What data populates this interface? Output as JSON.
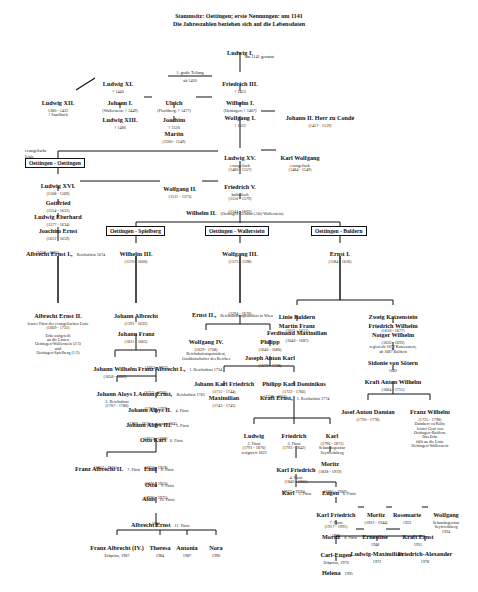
{
  "title": {
    "line1": "Stammsitz: Oettingen; erste Nennungen: um 1141",
    "line2": "Die Jahreszahlen beziehen sich auf die Lebensdaten"
  },
  "branches": {
    "oettingen_oettingen": "Oettingen - Oettingen",
    "oettingen_spielberg": "Oettingen - Spielberg",
    "oettingen_wallerstein": "Oettingen - Wallerstein",
    "oettingen_baldern": "Oettingen - Baldern"
  },
  "labels": {
    "evangelische_linie_1": "evangelische",
    "evangelische_linie_2": "Linie",
    "teilung_1": "1. große Teilung",
    "teilung_2": "ab 1410"
  },
  "persons": {
    "ludwig_1": {
      "name": "Ludwig I.",
      "note": "um 1141 genannt"
    },
    "ludwig_11": {
      "name": "Ludwig XI.",
      "dates": "† 1440"
    },
    "friedrich_3": {
      "name": "Friedrich III.",
      "dates": "† 1423"
    },
    "ludwig_12": {
      "name": "Ludwig XII.",
      "dates": "1380 - 1422",
      "note": "† Saarlbach"
    },
    "johann_1": {
      "name": "Johann I.",
      "dates": "(Wallerstein; † 1449)"
    },
    "ulrich": {
      "name": "Ulrich",
      "dates": "(Flochberg; † 1477)"
    },
    "wilhelm_1": {
      "name": "Wilhelm I.",
      "dates": "(Oettingen; † 1467)"
    },
    "ludwig_13": {
      "name": "Ludwig XIII.",
      "dates": "† 1486"
    },
    "joachim": {
      "name": "Joachim",
      "dates": "† 1520"
    },
    "wolfgang_1": {
      "name": "Wolfgang I.",
      "dates": "† 1522"
    },
    "johann_2": {
      "name": "Johann II. Herr zu Condé",
      "dates": "(1457 - 1519)"
    },
    "martin": {
      "name": "Martin",
      "dates": "(1500 - 1549)"
    },
    "ludwig_15": {
      "name": "Ludwig XV.",
      "note": "evangelisch",
      "dates": "(1486 - 1557)"
    },
    "karl_wolfgang": {
      "name": "Karl Wolfgang",
      "note": "evangelisch",
      "dates": "(1484 - 1549)"
    },
    "ludwig_16": {
      "name": "Ludwig XVI.",
      "dates": "(1508 - 1569)"
    },
    "wolfgang_2": {
      "name": "Wolfgang II.",
      "dates": "(1511 - 1573)"
    },
    "friedrich_5": {
      "name": "Friedrich V.",
      "note": "katholisch",
      "dates": "(1516 - 1579)"
    },
    "gottfried": {
      "name": "Gottfried",
      "dates": "(1554 - 1622)"
    },
    "wilhelm_2": {
      "name": "Wilhelm II.",
      "note": "(Oettingen-Gesamt (Alt)-Wallerstein)",
      "dates": "(1544 - 1602)"
    },
    "ludwig_eberhard": {
      "name": "Ludwig Eberhard",
      "dates": "(1577 - 1634)"
    },
    "joachim_ernst": {
      "name": "Joachim Ernst",
      "dates": "(1612 - 1659)"
    },
    "albrecht_ernst_1": {
      "name": "Albrecht Ernst I.,",
      "note": "Reichsfürst 1674",
      "dates": "(1642 - 1683)"
    },
    "wilhelm_3": {
      "name": "Wilhelm III.",
      "dates": "(1570 - 1600)"
    },
    "wolfgang_3": {
      "name": "Wolfgang III.",
      "dates": "(1573 - 1598)"
    },
    "ernst_1": {
      "name": "Ernst I.",
      "dates": "(1584 - 1626)"
    },
    "albrecht_ernst_2": {
      "name": "Albrecht Ernst II.",
      "note": "letzter Fürst der evangelischen Linie",
      "dates": "(1669 - 1731)",
      "inheritance": [
        "Erbe aufgeteilt",
        "an die Linien",
        "Oettingen-Wallerstein (2/3)",
        "und",
        "Oettingen-Spielberg (1/3)"
      ]
    },
    "johann_albrecht": {
      "name": "Johann Albrecht",
      "dates": "(1591 - 1632)"
    },
    "ernst_2": {
      "name": "Ernst II.,",
      "note": "Reichshofratspräsident in Wien",
      "dates": "(1594 - 1670)"
    },
    "linie_baldern": {
      "name": "Linie Baldern"
    },
    "martin_franz": {
      "name": "Martin Franz",
      "dates": "(1621 - 1653)"
    },
    "zweig_katzenstein": {
      "name": "Zweig Katzenstein"
    },
    "friedrich_wilhelm_1": {
      "name": "Friedrich Wilhelm",
      "dates": "(1618 - 1677)"
    },
    "johann_franz": {
      "name": "Johann Franz",
      "dates": "(1631 - 1665)"
    },
    "wolfgang_4": {
      "name": "Wolfgang IV.",
      "dates": "(1629 - 1708)",
      "note": [
        "Reichshofratspräsident,",
        "Großbotschafter des Reiches"
      ]
    },
    "philipp": {
      "name": "Philipp",
      "dates": "(1640 - 1680)"
    },
    "ferdinand_maximilian": {
      "name": "Ferdinand Maximilian",
      "dates": "(1640 - 1687)"
    },
    "notger_wilhelm": {
      "name": "Notger Wilhelm",
      "dates": "(1650 - 1693)",
      "note": [
        "regiert ab 1677 Katzenstein,",
        "ab 1687 Baldern"
      ]
    },
    "marriage_symbol": "∞",
    "sidonie": {
      "name": "Sidonie von Sötern",
      "dates": "1682"
    },
    "joseph_anton_karl": {
      "name": "Joseph Anton Karl",
      "dates": "(1679 - 1738)"
    },
    "johann_wilhelm": {
      "name": "Johann Wilhelm",
      "dates": "(1658 - 1683)"
    },
    "franz_albrecht_1": {
      "name": "Franz Albrecht I.,",
      "note": "1. Reichsfürst 1734",
      "dates": "(1663 - 1737)"
    },
    "kraft_anton_wilhelm": {
      "name": "Kraft Anton Wilhelm",
      "dates": "(1684 - 1751)"
    },
    "johann_karl_friedrich": {
      "name": "Johann Karl Friedrich",
      "dates": "(1715 - 1744)"
    },
    "philipp_karl_dominikus": {
      "name": "Philipp Karl Dominikus",
      "dates": "(1722 - 1766)"
    },
    "johann_aloys_1": {
      "name": "Johann Aloys I.",
      "note": "2. Reichsfürst",
      "dates": "(1707 - 1780)"
    },
    "anton_ernst": {
      "name": "Anton Ernst,",
      "note": "Reichsfürst 1765",
      "dates": "(1712 - 1768)"
    },
    "maximilian": {
      "name": "Maximilian",
      "dates": "(1743 - 1745)"
    },
    "kraft_ernst_1": {
      "name": "Kraft Ernst,",
      "note": "1. Reichsfürst 1774",
      "dates": "(1748 - 1802)"
    },
    "josef_anton_damian": {
      "name": "Josef Anton Damian",
      "dates": "(1720 - 1778)"
    },
    "franz_wilhelm": {
      "name": "Franz Wilhelm",
      "dates": "(1725 - 1798)",
      "note": [
        "Domherr zu Köln;",
        "letzter Graf von",
        "Oettingen-Baldern.",
        "Das Erbe",
        "fällt an die Linie",
        "Oettingen-Wallerstein"
      ]
    },
    "johann_aloys_2": {
      "name": "Johann Aloys II.",
      "note": "4. Fürst",
      "dates": "(1758 - 1797)"
    },
    "ludwig_fuerst2": {
      "name": "Ludwig",
      "note": "2. Fürst",
      "dates": "(1791 - 1870)",
      "note2": "resigniert 1823"
    },
    "friedrich_fuerst3": {
      "name": "Friedrich",
      "note": "3. Fürst",
      "dates": "(1793 - 1842)"
    },
    "karl_sekundo": {
      "name": "Karl",
      "dates": "(1796 - 1871)",
      "note": [
        "Sekundogenitur",
        "Seyfriedsberg"
      ]
    },
    "johann_aloys_3": {
      "name": "Johann Aloys III.",
      "note": "5. Fürst",
      "dates": "(1788 - 1855) resigniert 1845"
    },
    "karl_friedrich_4": {
      "name": "Karl Friedrich",
      "note": "4. Fürst",
      "dates": "(1840 - 1905)"
    },
    "moritz_1": {
      "name": "Moritz",
      "dates": "(1838 - 1919)"
    },
    "otto_karl": {
      "name": "Otto Karl",
      "note": "6. Fürst",
      "dates": "(1815 - 1882)"
    },
    "franz_albrecht_2": {
      "name": "Franz Albrecht II.",
      "note": "7. Fürst",
      "dates": "(1847 - 1916)"
    },
    "emil": {
      "name": "Emil",
      "note": "8. Fürst",
      "dates": "(1850 - 1919)"
    },
    "karl_5": {
      "name": "Karl",
      "note": "5. Fürst",
      "dates": "(1877 - 1930)"
    },
    "eugen": {
      "name": "Eugen",
      "note": "6. Fürst",
      "dates": "(1885 - 1969)"
    },
    "otto": {
      "name": "Otto",
      "note": "9. Fürst",
      "dates": "(1870 - 1952)"
    },
    "karl_friedrich_7": {
      "name": "Karl Friedrich",
      "note": "7. Fürst",
      "dates": "(1917 - 1991)"
    },
    "moritz_2": {
      "name": "Moritz",
      "dates": "(1922 - 1944)"
    },
    "rosemarie": {
      "name": "Rosemarie",
      "dates": "1923"
    },
    "wolfgang_sek": {
      "name": "Wolfgang",
      "note": [
        "Sekundogenitur",
        "Seyfriedsberg"
      ],
      "dates": "1924"
    },
    "alois": {
      "name": "Alois",
      "note": "10. Fürst",
      "dates": "(1920 - 1975)"
    },
    "moritz_8": {
      "name": "Moritz",
      "note": "8. Fürst",
      "dates": "1946"
    },
    "ernestine": {
      "name": "Ernestine",
      "dates": "1948"
    },
    "kraft_ernst_2": {
      "name": "Kraft Ernst",
      "dates": "1951"
    },
    "albrecht_ernst_11": {
      "name": "Albrecht Ernst",
      "note": "11. Fürst",
      "dates": "1951"
    },
    "carl_eugen": {
      "name": "Carl-Eugen",
      "note": "Erbprinz, 1970"
    },
    "ludwig_maximilian": {
      "name": "Ludwig-Maximilian",
      "dates": "1972"
    },
    "friedrich_alexander": {
      "name": "Friedrich-Alexander",
      "dates": "1978"
    },
    "helena": {
      "name": "Helena",
      "dates": "1995"
    },
    "franz_albrecht_4": {
      "name": "Franz Albrecht (IV.)",
      "note": "Erbprinz, 1987"
    },
    "theresa": {
      "name": "Theresa",
      "dates": "1984"
    },
    "antonia": {
      "name": "Antonia",
      "dates": "1987"
    },
    "nora": {
      "name": "Nora",
      "dates": "1990"
    }
  }
}
